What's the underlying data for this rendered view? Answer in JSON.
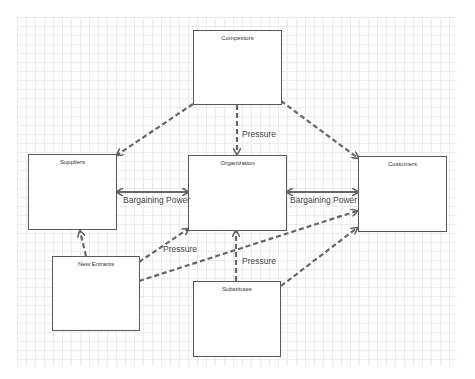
{
  "diagram": {
    "colors": {
      "box_border": "#595959",
      "arrow": "#666666",
      "grid": "#ececec",
      "text": "#333333"
    },
    "nodes": {
      "competitors": {
        "label": "Competitors"
      },
      "suppliers": {
        "label": "Suppliers"
      },
      "organization": {
        "label": "Organization"
      },
      "customers": {
        "label": "Customers"
      },
      "new_entrants": {
        "label": "New Entrants"
      },
      "substitutes": {
        "label": "Substitutes"
      }
    },
    "edges": [
      {
        "from": "Competitors",
        "to": "Suppliers",
        "style": "dashed",
        "label": ""
      },
      {
        "from": "Competitors",
        "to": "Organization",
        "style": "dashed",
        "label": "Pressure"
      },
      {
        "from": "Competitors",
        "to": "Customers",
        "style": "dashed",
        "label": ""
      },
      {
        "from": "Suppliers",
        "to": "Organization",
        "style": "solid-bidirectional",
        "label": "Bargaining Power"
      },
      {
        "from": "Organization",
        "to": "Customers",
        "style": "solid-bidirectional",
        "label": "Bargaining Power"
      },
      {
        "from": "New Entrants",
        "to": "Suppliers",
        "style": "dashed",
        "label": ""
      },
      {
        "from": "New Entrants",
        "to": "Organization",
        "style": "dashed",
        "label": "Pressure"
      },
      {
        "from": "New Entrants",
        "to": "Customers",
        "style": "dashed",
        "label": ""
      },
      {
        "from": "Substitutes",
        "to": "Organization",
        "style": "dashed",
        "label": "Pressure"
      },
      {
        "from": "Substitutes",
        "to": "Customers",
        "style": "dashed",
        "label": ""
      }
    ],
    "labels": {
      "competitors_pressure": "Pressure",
      "suppliers_bargaining": "Bargaining Power",
      "customers_bargaining": "Bargaining Power",
      "new_entrants_pressure": "Pressure",
      "substitutes_pressure": "Pressure"
    }
  }
}
